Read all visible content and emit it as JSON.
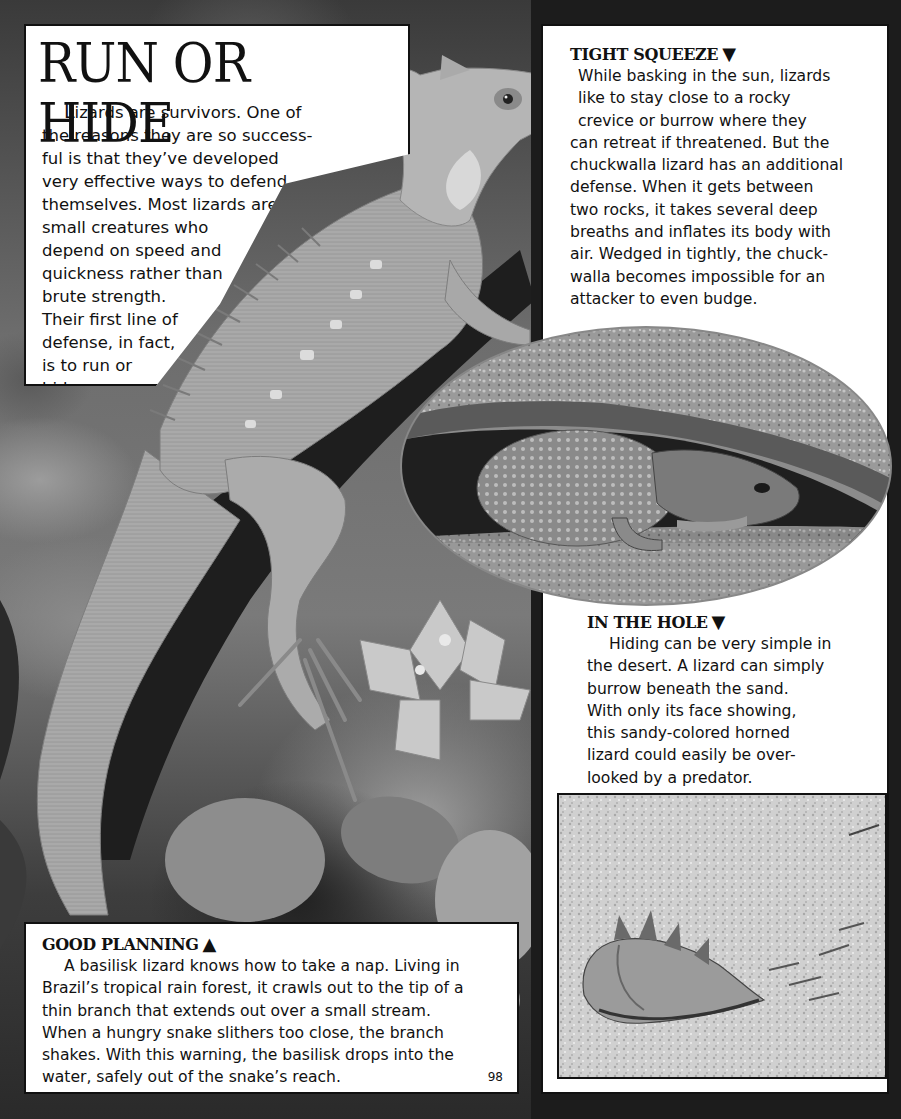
{
  "page": {
    "number": "98",
    "colors": {
      "frame": "#1c1c1c",
      "panel": "#ffffff",
      "text": "#111111"
    }
  },
  "title_box": {
    "title": "RUN OR HIDE",
    "intro_dropcap": "L",
    "intro_lines": [
      "izards are survivors. One of",
      "the reasons they are so success-",
      "ful is that they’ve developed",
      "very effective ways to defend",
      "themselves. Most lizards are",
      "small creatures who",
      "depend on speed and",
      "quickness rather than",
      "brute strength.",
      "Their first line of",
      "defense, in fact,",
      "is to run or",
      "hide."
    ]
  },
  "tight_squeeze": {
    "heading": "TIGHT SQUEEZE",
    "arrow": "▼",
    "lines": [
      "While basking in the sun, lizards",
      "like to stay close to a rocky",
      "crevice or burrow where they",
      "can retreat if threatened. But the",
      "chuckwalla lizard has an additional",
      "defense. When it gets between",
      "two rocks, it takes several deep",
      "breaths and inflates its body with",
      "air. Wedged in tightly, the chuck-",
      "walla becomes impossible for an",
      "attacker to even budge."
    ]
  },
  "in_the_hole": {
    "heading": "IN THE HOLE",
    "arrow": "▼",
    "lines": [
      "Hiding can be very simple in",
      "the desert. A lizard can simply",
      "burrow beneath the sand.",
      "With only its face showing,",
      "this sandy-colored horned",
      "lizard could easily be over-",
      "looked by a predator."
    ]
  },
  "good_planning": {
    "heading": "GOOD PLANNING",
    "arrow": "▲",
    "lines": [
      "A basilisk lizard knows how to take a nap. Living in",
      "Brazil’s tropical rain forest, it crawls out to the tip of a",
      "thin branch that extends out over a small stream.",
      "When a hungry snake slithers too close, the branch",
      "shakes. With this warning, the basilisk drops into the",
      "water, safely out of the snake’s reach."
    ]
  },
  "photos": {
    "main": "basilisk-lizard-on-branch-photo",
    "oval": "chuckwalla-under-rock-photo",
    "rect": "horned-lizard-in-sand-photo"
  }
}
